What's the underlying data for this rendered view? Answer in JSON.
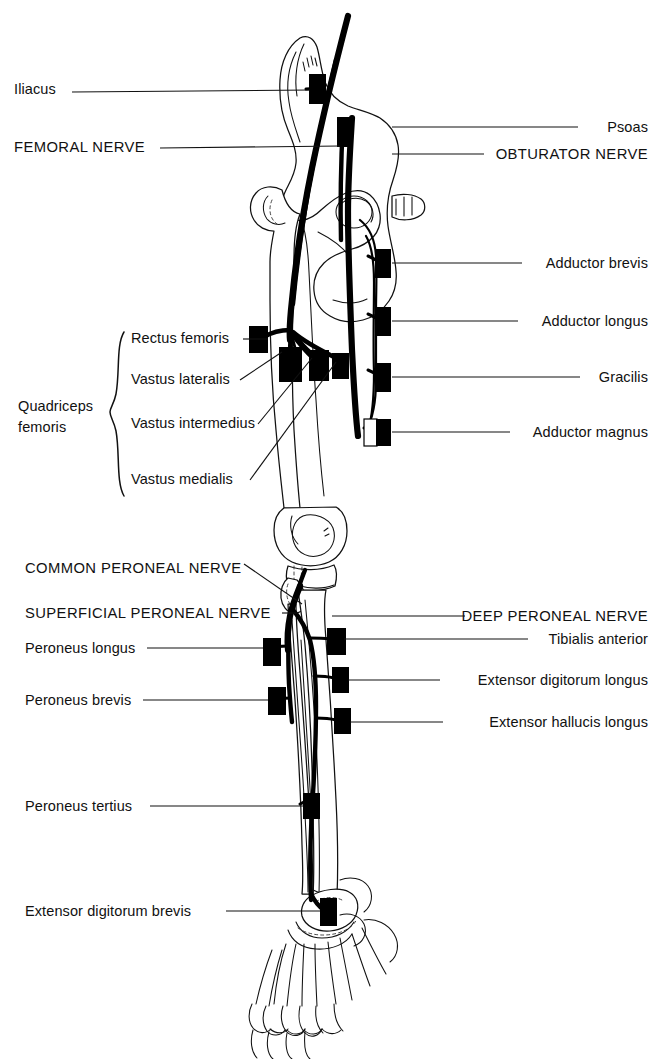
{
  "figure": {
    "accent_color": "#000000",
    "background_color": "#ffffff"
  },
  "labels_left": [
    {
      "id": "iliacus",
      "text": "Iliacus",
      "style": "mixed",
      "x": 14,
      "y": 90,
      "leader_to_x": 300,
      "leader_to_y": 88
    },
    {
      "id": "femoral-nerve",
      "text": "FEMORAL NERVE",
      "style": "caps",
      "x": 14,
      "y": 142,
      "leader_to_x": 322,
      "leader_to_y": 148
    },
    {
      "id": "rectus-femoris",
      "text": "Rectus femoris",
      "style": "mixed",
      "x": 131,
      "y": 336,
      "leader_to_x": 248,
      "leader_to_y": 340
    },
    {
      "id": "vastus-lateralis",
      "text": "Vastus lateralis",
      "style": "mixed",
      "x": 131,
      "y": 383,
      "leader_to_x": 280,
      "leader_to_y": 352
    },
    {
      "id": "vastus-intermedius",
      "text": "Vastus intermedius",
      "style": "mixed",
      "x": 131,
      "y": 427,
      "leader_to_x": 310,
      "leader_to_y": 356
    },
    {
      "id": "vastus-medialis",
      "text": "Vastus medialis",
      "style": "mixed",
      "x": 131,
      "y": 482,
      "leader_to_x": 333,
      "leader_to_y": 360
    },
    {
      "id": "quadriceps-femoris",
      "text": "Quadriceps\nfemoris",
      "style": "mixed",
      "x": 18,
      "y": 404
    },
    {
      "id": "common-peroneal-nerve",
      "text": "COMMON PERONEAL NERVE",
      "style": "caps",
      "x": 25,
      "y": 566,
      "leader_to_x": 305,
      "leader_to_y": 603
    },
    {
      "id": "superficial-peroneal-nerve",
      "text": "SUPERFICIAL PERONEAL NERVE",
      "style": "caps",
      "x": 25,
      "y": 613,
      "leader_to_x": 300,
      "leader_to_y": 615
    },
    {
      "id": "peroneus-longus",
      "text": "Peroneus longus",
      "style": "mixed",
      "x": 25,
      "y": 650,
      "leader_to_x": 263,
      "leader_to_y": 648
    },
    {
      "id": "peroneus-brevis",
      "text": "Peroneus brevis",
      "style": "mixed",
      "x": 25,
      "y": 701,
      "leader_to_x": 268,
      "leader_to_y": 700
    },
    {
      "id": "peroneus-tertius",
      "text": "Peroneus tertius",
      "style": "mixed",
      "x": 25,
      "y": 807,
      "leader_to_x": 303,
      "leader_to_y": 805
    },
    {
      "id": "extensor-digitorum-brevis",
      "text": "Extensor digitorum brevis",
      "style": "mixed",
      "x": 25,
      "y": 910,
      "leader_to_x": 320,
      "leader_to_y": 912
    }
  ],
  "labels_right": [
    {
      "id": "psoas",
      "text": "Psoas",
      "style": "mixed",
      "right": 4,
      "y": 124,
      "leader_from_x": 393,
      "leader_from_y": 128
    },
    {
      "id": "obturator-nerve",
      "text": "OBTURATOR NERVE",
      "style": "caps",
      "right": 4,
      "y": 150,
      "leader_from_x": 393,
      "leader_from_y": 155
    },
    {
      "id": "adductor-brevis",
      "text": "Adductor brevis",
      "style": "mixed",
      "right": 4,
      "y": 261,
      "leader_from_x": 391,
      "leader_from_y": 263
    },
    {
      "id": "adductor-longus",
      "text": "Adductor longus",
      "style": "mixed",
      "right": 4,
      "y": 318,
      "leader_from_x": 391,
      "leader_from_y": 321
    },
    {
      "id": "gracilis",
      "text": "Gracilis",
      "style": "mixed",
      "right": 4,
      "y": 372,
      "leader_from_x": 391,
      "leader_from_y": 377
    },
    {
      "id": "adductor-magnus",
      "text": "Adductor magnus",
      "style": "mixed",
      "right": 4,
      "y": 429,
      "leader_from_x": 391,
      "leader_from_y": 432
    },
    {
      "id": "deep-peroneal-nerve",
      "text": "DEEP PERONEAL NERVE",
      "style": "caps",
      "right": 4,
      "y": 612,
      "leader_from_x": 332,
      "leader_from_y": 616
    },
    {
      "id": "tibialis-anterior",
      "text": "Tibialis anterior",
      "style": "mixed",
      "right": 4,
      "y": 635,
      "leader_from_x": 342,
      "leader_from_y": 639
    },
    {
      "id": "extensor-digitorum-longus",
      "text": "Extensor digitorum longus",
      "style": "mixed",
      "right": 4,
      "y": 676,
      "leader_from_x": 348,
      "leader_from_y": 680
    },
    {
      "id": "extensor-hallucis-longus",
      "text": "Extensor hallucis longus",
      "style": "mixed",
      "right": 4,
      "y": 718,
      "leader_from_x": 350,
      "leader_from_y": 722
    }
  ],
  "markers": [
    {
      "id": "marker-iliacus",
      "x": 309,
      "y": 74,
      "w": 17,
      "h": 30,
      "filled": true
    },
    {
      "id": "marker-femoral-nerve",
      "x": 337,
      "y": 117,
      "w": 16,
      "h": 30,
      "filled": true
    },
    {
      "id": "marker-adductor-brevis",
      "x": 375,
      "y": 249,
      "w": 16,
      "h": 29,
      "filled": true
    },
    {
      "id": "marker-adductor-longus",
      "x": 375,
      "y": 307,
      "w": 16,
      "h": 29,
      "filled": true
    },
    {
      "id": "marker-gracilis",
      "x": 375,
      "y": 363,
      "w": 16,
      "h": 29,
      "filled": true
    },
    {
      "id": "marker-adductor-magnus-open",
      "x": 364,
      "y": 419,
      "w": 13,
      "h": 27,
      "filled": false
    },
    {
      "id": "marker-adductor-magnus",
      "x": 376,
      "y": 419,
      "w": 15,
      "h": 27,
      "filled": true
    },
    {
      "id": "marker-rectus-femoris",
      "x": 249,
      "y": 326,
      "w": 19,
      "h": 27,
      "filled": true
    },
    {
      "id": "marker-vastus-lateralis",
      "x": 279,
      "y": 347,
      "w": 23,
      "h": 35,
      "filled": true
    },
    {
      "id": "marker-vastus-intermedius",
      "x": 309,
      "y": 350,
      "w": 20,
      "h": 31,
      "filled": true
    },
    {
      "id": "marker-vastus-medialis",
      "x": 332,
      "y": 353,
      "w": 17,
      "h": 26,
      "filled": true
    },
    {
      "id": "marker-tibialis-anterior",
      "x": 327,
      "y": 628,
      "w": 19,
      "h": 27,
      "filled": true
    },
    {
      "id": "marker-peroneus-longus",
      "x": 263,
      "y": 638,
      "w": 18,
      "h": 28,
      "filled": true
    },
    {
      "id": "marker-ext-dig-longus",
      "x": 332,
      "y": 667,
      "w": 17,
      "h": 26,
      "filled": true
    },
    {
      "id": "marker-peroneus-brevis",
      "x": 268,
      "y": 687,
      "w": 18,
      "h": 28,
      "filled": true
    },
    {
      "id": "marker-ext-hall-longus",
      "x": 334,
      "y": 708,
      "w": 17,
      "h": 26,
      "filled": true
    },
    {
      "id": "marker-peroneus-tertius",
      "x": 303,
      "y": 793,
      "w": 17,
      "h": 26,
      "filled": true
    },
    {
      "id": "marker-ext-dig-brevis",
      "x": 320,
      "y": 898,
      "w": 17,
      "h": 28,
      "filled": true
    }
  ],
  "brace": {
    "id": "quadriceps-brace",
    "x": 112,
    "top": 332,
    "bottom": 496
  }
}
